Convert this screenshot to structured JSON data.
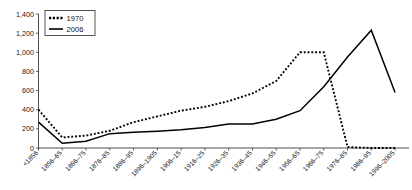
{
  "chart_data": {
    "type": "line",
    "title": "",
    "xlabel": "",
    "ylabel": "",
    "ylim": [
      0,
      1400
    ],
    "ytick_step": 200,
    "grid": false,
    "legend_position": "top-left",
    "categories": [
      "<1856",
      "1856–65",
      "1866–75",
      "1876–85",
      "1886–95",
      "1896–1905",
      "1906–15",
      "1916–25",
      "1926–35",
      "1936–45",
      "1946–55",
      "1956–65",
      "1966–75",
      "1976–85",
      "1986–95",
      "1996–2005"
    ],
    "ytick_labels": [
      "0",
      "200",
      "400",
      "600",
      "800",
      "1,000",
      "1,200",
      "1,400"
    ],
    "ytick_values": [
      0,
      200,
      400,
      600,
      800,
      1000,
      1200,
      1400
    ],
    "series": [
      {
        "name": "1970",
        "style": "dotted",
        "color": "#000000",
        "values": [
          400,
          110,
          130,
          180,
          270,
          330,
          390,
          430,
          490,
          570,
          700,
          1000,
          1000,
          10,
          0,
          0
        ]
      },
      {
        "name": "2006",
        "style": "solid",
        "color": "#000000",
        "values": [
          270,
          50,
          70,
          150,
          165,
          175,
          190,
          215,
          250,
          250,
          300,
          390,
          640,
          950,
          1230,
          580
        ]
      }
    ]
  },
  "legend": {
    "items": [
      {
        "label": "1970",
        "style": "dotted"
      },
      {
        "label": "2006",
        "style": "solid"
      }
    ]
  }
}
